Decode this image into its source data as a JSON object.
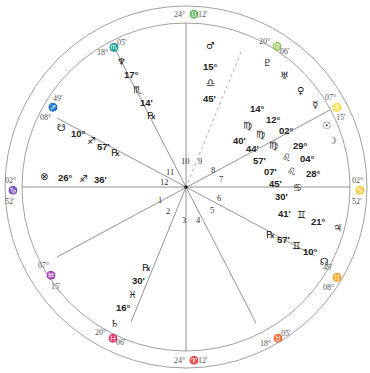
{
  "chart": {
    "center": [
      186,
      187
    ],
    "outer_radius": 181,
    "inner_radius": 164
  },
  "cusp_labels": [
    {
      "id": "mc",
      "deg": "24°",
      "sign": "♎",
      "min": "12'"
    },
    {
      "id": "ic",
      "deg": "24°",
      "sign": "♈",
      "min": "12'"
    },
    {
      "id": "asc",
      "deg": "02°",
      "sign": "♑",
      "min": "52'"
    },
    {
      "id": "dsc",
      "deg": "02°",
      "sign": "♋",
      "min": "52'"
    },
    {
      "id": "c11",
      "deg": "18°",
      "sign": "♏",
      "min": "05'"
    },
    {
      "id": "c12",
      "deg": "08°",
      "sign": "♐",
      "min": "49'"
    },
    {
      "id": "c9",
      "deg": "20°",
      "sign": "♍",
      "min": "06'"
    },
    {
      "id": "c8",
      "deg": "07°",
      "sign": "♌",
      "min": "15'"
    },
    {
      "id": "c2",
      "deg": "07°",
      "sign": "♒",
      "min": "15'"
    },
    {
      "id": "c3",
      "deg": "20°",
      "sign": "♓",
      "min": "06'"
    },
    {
      "id": "c5",
      "deg": "18°",
      "sign": "♉",
      "min": "05'"
    },
    {
      "id": "c6",
      "deg": "08°",
      "sign": "♊",
      "min": "49'"
    }
  ],
  "house_numbers": [
    "1",
    "2",
    "3",
    "4",
    "5",
    "6",
    "7",
    "8",
    "9",
    "10",
    "11",
    "12"
  ],
  "planets": {
    "mars": {
      "glyph": "♂",
      "deg": "15°",
      "sign": "♎",
      "min": "45'"
    },
    "neptune": {
      "glyph": "♆",
      "deg": "17°",
      "sign": "♏",
      "min": "14'",
      "retro": "℞"
    },
    "south_node": {
      "glyph": "☋",
      "deg": "10°",
      "sign": "♐",
      "min": "57'",
      "retro": "℞"
    },
    "part_of_fortune": {
      "glyph": "⊗",
      "deg": "26°",
      "sign": "♐",
      "min": "36'"
    },
    "pluto": {
      "glyph": "♇",
      "deg": "14°",
      "sign": "♍",
      "min": "40'"
    },
    "uranus": {
      "glyph": "♅",
      "deg": "12°",
      "sign": "♍",
      "min": "44'"
    },
    "venus": {
      "glyph": "♀",
      "deg": "02°",
      "sign": "♍",
      "min": "57'"
    },
    "mercury": {
      "glyph": "☿",
      "deg": "29°",
      "sign": "♌",
      "min": "07'"
    },
    "sun": {
      "glyph": "☉",
      "deg": "04°",
      "sign": "♌",
      "min": "45'"
    },
    "moon": {
      "glyph": "☽",
      "deg": "28°",
      "sign": "♋",
      "min": "30'"
    },
    "saturn": {
      "glyph": "♄",
      "deg": "16°",
      "sign": "♓",
      "min": "30'",
      "retro": "℞"
    },
    "jupiter": {
      "glyph": "♃",
      "deg": "21°",
      "sign": "♊",
      "min": "41'"
    },
    "north_node": {
      "glyph": "☊",
      "deg": "10°",
      "sign": "♊",
      "min": "57'",
      "retro": "℞"
    }
  }
}
